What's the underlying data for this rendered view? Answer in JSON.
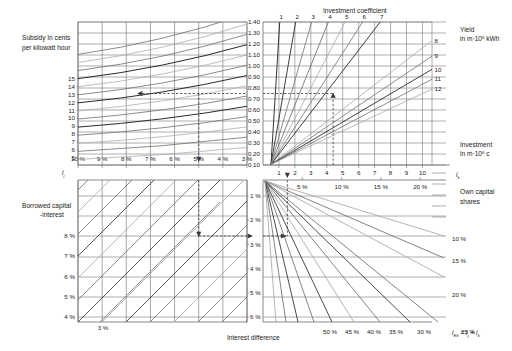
{
  "chart_data": {
    "type": "line",
    "quadrants": [
      {
        "id": "top-left",
        "name": "subsidy-vs-total-interest",
        "ylabel": "Subsidy In cents per kilowatt hour",
        "xlabel": "i_j",
        "x_ticks": [
          "10 %",
          "9 %",
          "8 %",
          "7 %",
          "6 %",
          "5 %",
          "4 %",
          "3 %"
        ],
        "x_values": [
          10,
          9,
          8,
          7,
          6,
          5,
          4,
          3
        ],
        "x_direction": "decreasing",
        "y_ticks": [
          "15",
          "14",
          "13",
          "12",
          "11",
          "10",
          "9",
          "8",
          "7",
          "6",
          "5"
        ],
        "y_values": [
          15,
          14,
          13,
          12,
          11,
          10,
          9,
          8,
          7,
          6,
          5
        ],
        "ylim": [
          4.2,
          18.5
        ],
        "grid": true,
        "curve_count": 14,
        "note": "family of rising curves mapping interest to subsidy"
      },
      {
        "id": "top-right",
        "name": "investment-coefficient-vs-investment",
        "ylabel": "Investment coefficient",
        "ylabel_right_1": "Yield",
        "ylabel_right_2": "in m·10⁶ kWh",
        "ylabel_right_3": "Investment",
        "ylabel_right_4": "in m·10⁶ c",
        "xlabel": "i_k",
        "x_ticks": [
          "1",
          "2",
          "3",
          "4",
          "5",
          "6",
          "7",
          "8",
          "9",
          "10"
        ],
        "x_values": [
          1,
          2,
          3,
          4,
          5,
          6,
          7,
          8,
          9,
          10
        ],
        "y_ticks": [
          "1.40",
          "1.30",
          "1.20",
          "1.10",
          "1.00",
          "0.90",
          "0.80",
          "0.70",
          "0.60",
          "0.50",
          "0.40",
          "0.30",
          "0.20",
          "0.10"
        ],
        "y_values": [
          1.4,
          1.3,
          1.2,
          1.1,
          1.0,
          0.9,
          0.8,
          0.7,
          0.6,
          0.5,
          0.4,
          0.3,
          0.2,
          0.1
        ],
        "ylim": [
          0.05,
          1.45
        ],
        "xlim": [
          0,
          10.6
        ],
        "grid": true,
        "ray_labels_top": [
          "1",
          "2",
          "3",
          "4",
          "5",
          "6",
          "7"
        ],
        "ray_labels_right": [
          "8",
          "9",
          "10",
          "11",
          "12"
        ],
        "yield_series": [
          1,
          2,
          3,
          4,
          5,
          6,
          7,
          8,
          9,
          10,
          11,
          12
        ]
      },
      {
        "id": "bottom-left",
        "name": "borrowed-capital-interest-vs-difference",
        "ylabel": "Borrowed capital -interest",
        "xlabel": "Interest difference",
        "y_ticks": [
          "8 %",
          "7 %",
          "6 %",
          "5 %",
          "4 %"
        ],
        "y_values": [
          8,
          7,
          6,
          5,
          4
        ],
        "y_ticks_right": [
          "1 %",
          "2 %",
          "3 %",
          "4 %",
          "5 %",
          "6 %"
        ],
        "x_tick_label": "3 %",
        "grid": true,
        "diagonal_count": 7
      },
      {
        "id": "bottom-right",
        "name": "own-capital-share-vs-total-interest",
        "xlabel_top_ticks": [
          "5 %",
          "10 %",
          "15 %",
          "20 %"
        ],
        "xlabel_bottom_ticks": [
          "50 %",
          "45 %",
          "40 %",
          "35 %",
          "30 %",
          "25 %"
        ],
        "right_label_title_1": "Own capital",
        "right_label_title_2": "shares",
        "right_labels": [
          "10 %",
          "15 %",
          "20 %"
        ],
        "xlabel_formula_prefix": "i",
        "xlabel_formula_sub": "Ek",
        "xlabel_formula_rest": " = i",
        "xlabel_formula_sub2": "j",
        "xlabel_formula_rest2": " + i",
        "xlabel_formula_sub3": "k",
        "grid": true,
        "fan_count": 12
      }
    ],
    "worked_example": {
      "description": "dashed construction path with arrowheads",
      "investment_coefficient_value": 0.75,
      "interest_ij_value": "5 %",
      "subsidy_value": 12,
      "borrowed_capital_interest": "8 %",
      "interest_difference": "2 %",
      "investment_ik_value": 4.4
    },
    "colors": {
      "grid": "#6b6b6b",
      "curve_dark": "#2a2a2a",
      "curve_mid": "#6e6e6e",
      "curve_light": "#a8a8a8",
      "dashed": "#3a3a3a",
      "text": "#1a1a1a",
      "background": "#ffffff"
    }
  },
  "labels": {
    "subsidy_line1": "Subsidy In cents",
    "subsidy_line2": "per kilowatt hour",
    "investment_coefficient": "Investment coefficient",
    "yield_line1": "Yield",
    "yield_line2": "in m·10",
    "yield_exp": "6",
    "yield_line2b": " kWh",
    "investment_line1": "Investment",
    "investment_line2": "in m·10",
    "investment_exp": "6",
    "investment_line2b": " c",
    "borrowed_line1": "Borrowed capital",
    "borrowed_line2": "-interest",
    "own_capital_line1": "Own capital",
    "own_capital_line2": "shares",
    "interest_difference": "Interest difference",
    "axis_ij": "i",
    "axis_ij_sub": "j",
    "axis_ik": "i",
    "axis_ik_sub": "k"
  }
}
